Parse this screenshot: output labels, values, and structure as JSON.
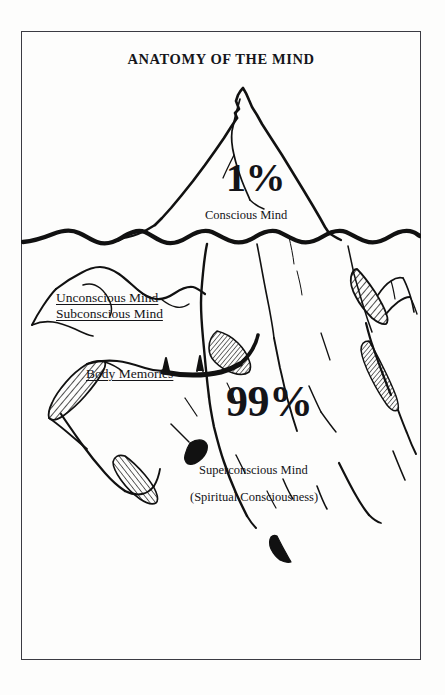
{
  "page": {
    "title": "ANATOMY OF THE MIND",
    "background_color": "#fdfdfc",
    "border_color": "#3b3b42",
    "ink_color": "#111111"
  },
  "diagram": {
    "type": "iceberg-metaphor",
    "waterline_label": "sea-level",
    "above_water": {
      "percentage": "1%",
      "label": "Conscious Mind"
    },
    "below_water": {
      "percentage": "99%",
      "label": "Superconscious Mind",
      "sublabel": "(Spiritual Consciousness)"
    },
    "side_labels": [
      {
        "text": "Unconscious Mind",
        "underlined": true
      },
      {
        "text": "Subconscious Mind",
        "underlined": true
      },
      {
        "text": "Body Memories",
        "underlined": true
      }
    ]
  }
}
